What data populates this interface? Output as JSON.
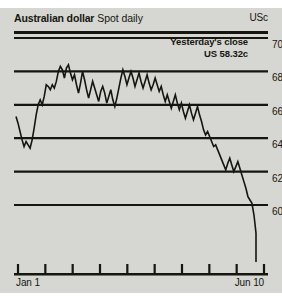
{
  "header": {
    "series_title": "Australian dollar",
    "series_subtitle": "Spot daily",
    "unit_label": "USc"
  },
  "annotation": {
    "line1": "Yesterday's close",
    "line2": "US 58.32c"
  },
  "chart_data": {
    "type": "line",
    "title": "Australian dollar Spot daily",
    "xlabel": "",
    "ylabel": "USc",
    "ylim": [
      58,
      70
    ],
    "yticks": [
      70,
      68,
      66,
      64,
      62,
      60
    ],
    "grid": true,
    "legend": false,
    "line_color": "#16160f",
    "background_color": "#d6d6d2",
    "xtick_labels": [
      "Jan 1",
      "Jun 10"
    ],
    "xtick_positions": [
      0,
      8
    ],
    "xtick_count": 10,
    "annotations": [
      {
        "text": "Yesterday's close US 58.32c",
        "value": 58.32
      }
    ],
    "x": [
      0,
      1,
      2,
      3,
      4,
      5,
      6,
      7,
      8,
      9,
      10,
      11,
      12,
      13,
      14,
      15,
      16,
      17,
      18,
      19,
      20,
      21,
      22,
      23,
      24,
      25,
      26,
      27,
      28,
      29,
      30,
      31,
      32,
      33,
      34,
      35,
      36,
      37,
      38,
      39,
      40,
      41,
      42,
      43,
      44,
      45,
      46,
      47,
      48,
      49,
      50,
      51,
      52,
      53,
      54,
      55,
      56,
      57,
      58,
      59,
      60,
      61,
      62,
      63,
      64,
      65,
      66,
      67,
      68,
      69,
      70,
      71,
      72,
      73,
      74,
      75,
      76,
      77,
      78,
      79,
      80,
      81,
      82,
      83,
      84,
      85,
      86,
      87,
      88,
      89,
      90,
      91,
      92,
      93,
      94,
      95,
      96,
      97,
      98,
      99,
      100,
      101,
      102,
      103,
      104,
      105,
      106,
      107,
      108,
      109,
      110,
      111,
      112,
      113,
      114,
      115,
      116,
      117,
      118,
      119
    ],
    "values": [
      65.3,
      64.9,
      64.4,
      63.9,
      63.5,
      63.8,
      63.6,
      63.4,
      63.9,
      64.6,
      65.4,
      66.0,
      66.3,
      66.0,
      66.5,
      67.2,
      67.1,
      66.9,
      67.2,
      67.0,
      67.4,
      68.0,
      68.3,
      68.1,
      67.6,
      68.2,
      68.4,
      67.9,
      67.5,
      67.8,
      67.2,
      66.7,
      67.3,
      68.0,
      67.5,
      66.9,
      66.4,
      66.9,
      67.4,
      67.0,
      66.6,
      66.2,
      66.8,
      67.1,
      66.7,
      66.1,
      66.5,
      66.9,
      66.3,
      65.9,
      66.4,
      67.0,
      67.6,
      68.1,
      67.7,
      67.2,
      67.6,
      68.0,
      67.6,
      67.1,
      67.5,
      67.9,
      67.4,
      67.0,
      67.4,
      67.8,
      67.3,
      66.9,
      67.2,
      67.6,
      67.2,
      66.8,
      67.1,
      66.6,
      66.2,
      66.6,
      66.2,
      65.8,
      66.2,
      66.6,
      66.1,
      65.7,
      66.1,
      65.6,
      65.2,
      65.6,
      66.0,
      65.5,
      65.1,
      65.5,
      65.9,
      65.4,
      65.0,
      64.5,
      64.2,
      64.4,
      64.1,
      63.8,
      63.5,
      63.6,
      63.3,
      63.0,
      62.7,
      62.4,
      62.1,
      62.5,
      62.8,
      62.4,
      62.0,
      62.3,
      62.6,
      62.2,
      61.8,
      61.4,
      61.0,
      60.5,
      60.3,
      60.1,
      59.4,
      58.32
    ]
  }
}
